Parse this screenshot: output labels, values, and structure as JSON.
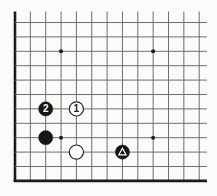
{
  "diagram": {
    "board": {
      "visible_cols": 13,
      "visible_rows": 12,
      "edges": {
        "left": true,
        "bottom": true,
        "top": false,
        "right": false
      },
      "star_points": [
        {
          "col": 4,
          "row": 3
        },
        {
          "col": 10,
          "row": 3
        },
        {
          "col": 4,
          "row": 9
        },
        {
          "col": 10,
          "row": 9
        }
      ],
      "stones": [
        {
          "id": "black-move-2",
          "col": 3,
          "row": 7,
          "color": "black",
          "label": "2",
          "marker": ""
        },
        {
          "id": "white-move-1",
          "col": 5,
          "row": 7,
          "color": "white",
          "label": "1",
          "marker": ""
        },
        {
          "id": "black-stone-komoku",
          "col": 3,
          "row": 9,
          "color": "black",
          "label": "",
          "marker": ""
        },
        {
          "id": "white-stone-approach",
          "col": 5,
          "row": 10,
          "color": "white",
          "label": "",
          "marker": ""
        },
        {
          "id": "black-stone-pincer",
          "col": 8,
          "row": 10,
          "color": "black",
          "label": "",
          "marker": "triangle"
        }
      ]
    },
    "geometry": {
      "width": 217,
      "height": 196,
      "x0": 15,
      "y0": 22.5,
      "dx": 15.35,
      "dy": 14.4,
      "v_top": 11.5,
      "h_right": 207,
      "stone_radius": 7.1,
      "star_radius": 2.0,
      "thin_line_width": 0.9,
      "edge_line_width": 2.6,
      "label_font_size": 10
    },
    "colors": {
      "background": "#fbfbf9",
      "grid_line": "#5f5f5f",
      "board_edge": "#1c1c1c",
      "black_stone": "#161616",
      "white_stone": "#ffffff",
      "white_stone_outline": "#2a2a2a",
      "black_label": "#ffffff",
      "white_label": "#1a1a1a",
      "triangle_marker": "#ffffff",
      "star_point": "#1e1e1e"
    }
  }
}
